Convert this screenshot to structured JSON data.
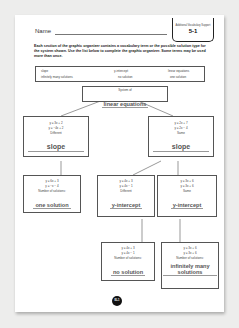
{
  "header": {
    "name_label": "Name",
    "tab_subtitle": "Additional Vocabulary Support",
    "tab_number": "5-1"
  },
  "instructions": "Each section of the graphic organizer contains a vocabulary term or the possible solution type for the system shown. Use the list below to complete the graphic organizer. Some terms may be used more than once.",
  "word_bank": [
    "slope",
    "y-intercept",
    "linear equations",
    "infinitely many solutions",
    "no solution",
    "one solution"
  ],
  "organizer": {
    "root": {
      "label": "System of",
      "answer": "linear equations"
    },
    "left": {
      "eq1": "y = 3x + 2",
      "eq2": "y = −4x + 2",
      "label": "Different",
      "answer": "slope"
    },
    "right": {
      "eq1": "y = 2x + 7",
      "eq2": "y = 2x − 4",
      "label": "Same",
      "answer": "slope"
    },
    "left_child": {
      "eq1": "y = 6x + 3",
      "eq2": "y = −x − 4",
      "label": "Number of solutions:",
      "answer": "one solution"
    },
    "mid_child": {
      "eq1": "y = 4x + 3",
      "eq2": "y = 4x − 1",
      "label": "Different",
      "answer": "y-intercept"
    },
    "right_child": {
      "eq1": "y = 3x + 6",
      "eq2": "y = 3x + 6",
      "label": "Same",
      "answer": "y-intercept"
    },
    "mid_leaf": {
      "eq1": "y = 4x + 3",
      "eq2": "y = 4x − 1",
      "label": "Number of solutions:",
      "answer": "no solution"
    },
    "right_leaf": {
      "eq1": "y = 3x + 6",
      "eq2": "y = 3x + 6",
      "label": "Number of solutions:",
      "answer": "infinitely many solutions"
    }
  },
  "footer": {
    "page_number": "EL1"
  }
}
